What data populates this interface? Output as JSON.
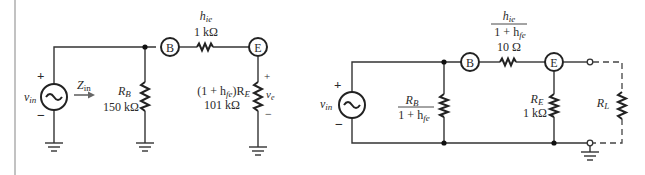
{
  "left_circuit": {
    "source": {
      "label": "v",
      "sub": "in",
      "plus": "+",
      "minus": "−"
    },
    "zin": {
      "label": "Z",
      "sub": "in"
    },
    "rb": {
      "name": "R",
      "sub": "B",
      "value": "150 kΩ"
    },
    "node_b": "B",
    "node_e": "E",
    "hie": {
      "name": "h",
      "sub": "ie",
      "value": "1 kΩ"
    },
    "re_equiv": {
      "prefix": "(1 + h",
      "sub": "fe",
      "suffix": ")R",
      "sub2": "E",
      "value": "101 kΩ"
    },
    "ve": {
      "label": "v",
      "sub": "e",
      "plus": "+",
      "minus": "−"
    }
  },
  "right_circuit": {
    "source": {
      "label": "v",
      "sub": "in",
      "plus": "+",
      "minus": "−"
    },
    "rb_frac": {
      "num": "R",
      "num_sub": "B",
      "den": "1 + h",
      "den_sub": "fe"
    },
    "node_b": "B",
    "node_e": "E",
    "hie_frac": {
      "num": "h",
      "num_sub": "ie",
      "den": "1 + h",
      "den_sub": "fe",
      "value": "10 Ω"
    },
    "re": {
      "name": "R",
      "sub": "E",
      "value": "1 kΩ"
    },
    "rl": {
      "name": "R",
      "sub": "L"
    }
  }
}
